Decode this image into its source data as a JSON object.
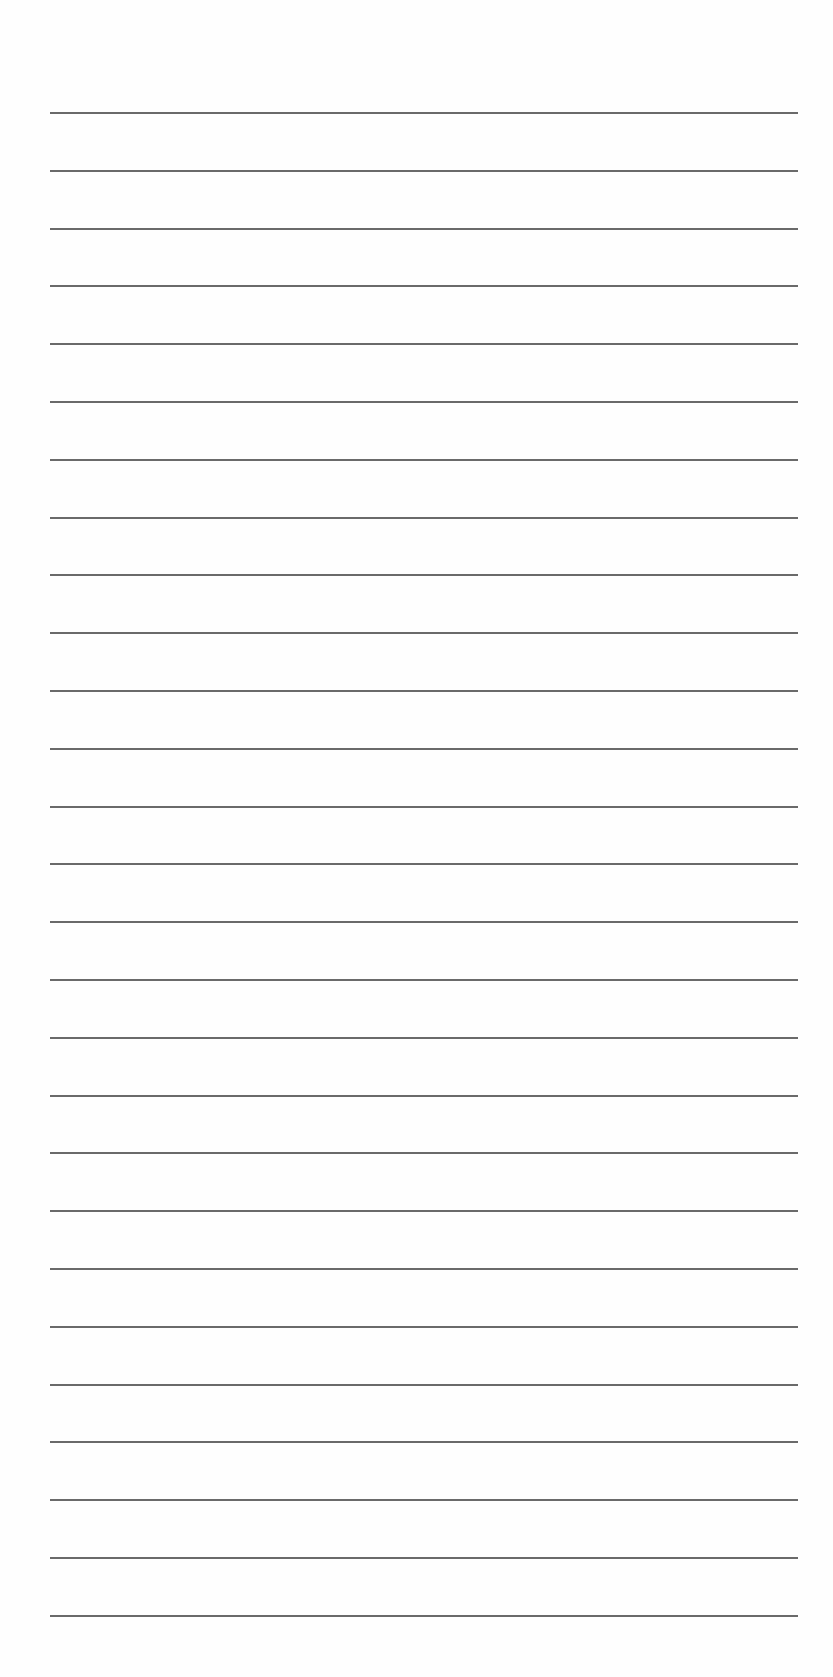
{
  "page": {
    "type": "lined-paper",
    "background_color": "#fefefe",
    "rule_color": "#5a5a5a",
    "rule_count": 27,
    "rule_first_y": 112,
    "rule_spacing": 57.8,
    "rule_left": 50,
    "rule_width": 748,
    "bleed_text": ""
  }
}
